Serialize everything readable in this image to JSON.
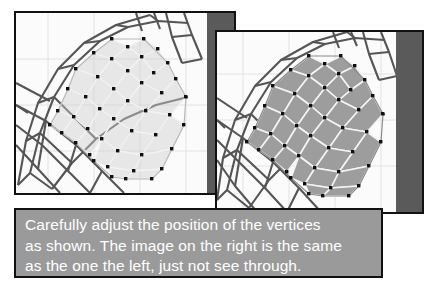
{
  "document": {
    "title": "Mesh vertex adjustment tutorial figure",
    "background_color": "#ffffff"
  },
  "panels": [
    {
      "id": "left",
      "name": "left-viewport-panel",
      "mode_label": "see-through",
      "description": "3D viewport showing a low-poly head mesh rendered semi-transparent over a wireframe lattice cage",
      "border_color": "#111111",
      "viewport_background": "#fbfbfb",
      "grid_color": "#e2e2e2",
      "shade_band_color": "#5a5a5a",
      "mesh_fill_color": "#cfcfcf",
      "mesh_edge_color": "#f2f2f2",
      "vertex_color": "#101010",
      "cage_color": "#555555"
    },
    {
      "id": "right",
      "name": "right-viewport-panel",
      "mode_label": "solid",
      "description": "Same 3D viewport and mesh rendered opaque, not see-through",
      "border_color": "#111111",
      "viewport_background": "#fbfbfb",
      "grid_color": "#e2e2e2",
      "shade_band_color": "#5a5a5a",
      "mesh_fill_color": "#9d9d9d",
      "mesh_edge_color": "#f4f4f4",
      "vertex_color": "#101010",
      "cage_color": "#555555"
    }
  ],
  "caption": {
    "text": "Carefully adjust the position of the vertices\nas shown. The image on the right is the same\nas the one the left, just not see through.",
    "background_color": "#9a9a9a",
    "text_color": "#ffffff",
    "border_color": "#111111"
  }
}
